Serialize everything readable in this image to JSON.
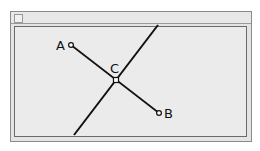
{
  "window": {
    "title": "",
    "close_icon": "close-box-icon"
  },
  "diagram": {
    "labels": {
      "A": "A",
      "B": "B",
      "C": "C"
    },
    "points": {
      "A": {
        "x": 71,
        "y": 45
      },
      "B": {
        "x": 159,
        "y": 113
      },
      "C": {
        "x": 116,
        "y": 80
      }
    },
    "segment_AB": {
      "from": "A",
      "to": "B"
    },
    "crossing_line": {
      "x1": 158,
      "y1": 25,
      "x2": 74,
      "y2": 135
    },
    "line_color": "#111111"
  }
}
